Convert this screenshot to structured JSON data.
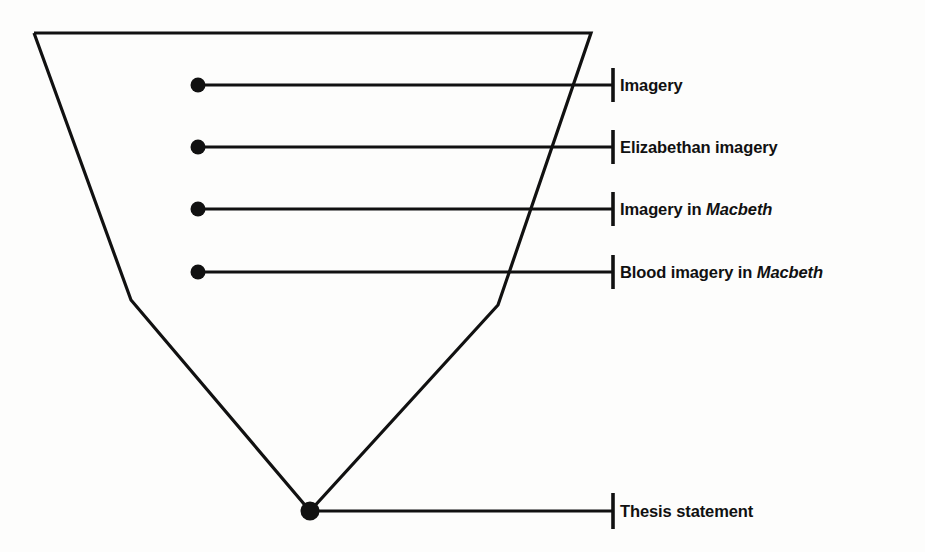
{
  "diagram": {
    "type": "funnel-narrowing-topic",
    "background_color": "#fdfdfc",
    "ink_color": "#111111",
    "funnel": {
      "name": "inverted-trapezoid-funnel",
      "points": "34,33 591,33 498,305 310,511 131,300 34,33",
      "stroke_width": 3.2
    },
    "rows": [
      {
        "id": "row-imagery",
        "label": "Imagery",
        "label_prefix": "Imagery",
        "label_italic": "",
        "label_suffix": "",
        "dot_x": 198,
        "dot_y": 85,
        "dot_r": 7.5,
        "line_x2": 613,
        "tick_x": 613,
        "tick_y1": 68,
        "tick_y2": 102,
        "text_x": 620
      },
      {
        "id": "row-elizabethan-imagery",
        "label": "Elizabethan imagery",
        "label_prefix": "Elizabethan imagery",
        "label_italic": "",
        "label_suffix": "",
        "dot_x": 198,
        "dot_y": 147,
        "dot_r": 7.5,
        "line_x2": 613,
        "tick_x": 613,
        "tick_y1": 130,
        "tick_y2": 164,
        "text_x": 620
      },
      {
        "id": "row-imagery-in-macbeth",
        "label": "Imagery in Macbeth",
        "label_prefix": "Imagery in ",
        "label_italic": "Macbeth",
        "label_suffix": "",
        "dot_x": 198,
        "dot_y": 209,
        "dot_r": 7.5,
        "line_x2": 613,
        "tick_x": 613,
        "tick_y1": 192,
        "tick_y2": 226,
        "text_x": 620
      },
      {
        "id": "row-blood-imagery-in-macbeth",
        "label": "Blood imagery in Macbeth",
        "label_prefix": "Blood imagery in ",
        "label_italic": "Macbeth",
        "label_suffix": "",
        "dot_x": 198,
        "dot_y": 272,
        "dot_r": 7.5,
        "line_x2": 613,
        "tick_x": 613,
        "tick_y1": 255,
        "tick_y2": 289,
        "text_x": 620
      },
      {
        "id": "row-thesis-statement",
        "label": "Thesis statement",
        "label_prefix": "Thesis statement",
        "label_italic": "",
        "label_suffix": "",
        "dot_x": 310,
        "dot_y": 511,
        "dot_r": 9.5,
        "line_x2": 613,
        "tick_x": 613,
        "tick_y1": 493,
        "tick_y2": 529,
        "text_x": 620
      }
    ]
  }
}
